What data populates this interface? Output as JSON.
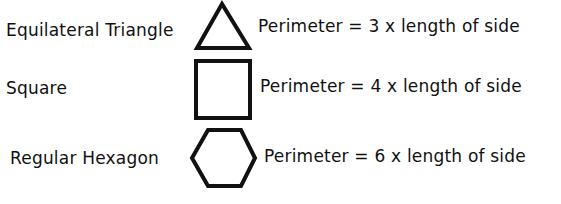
{
  "rows": [
    {
      "shape_name": "Equilateral Triangle",
      "shape_icon": "triangle-icon",
      "formula": "Perimeter = 3 x length of side"
    },
    {
      "shape_name": "Square",
      "shape_icon": "square-icon",
      "formula": "Perimeter = 4 x length of side"
    },
    {
      "shape_name": "Regular Hexagon",
      "shape_icon": "hexagon-icon",
      "formula": "Perimeter = 6 x length of side"
    }
  ],
  "colors": {
    "stroke": "#111111",
    "background": "#ffffff"
  }
}
